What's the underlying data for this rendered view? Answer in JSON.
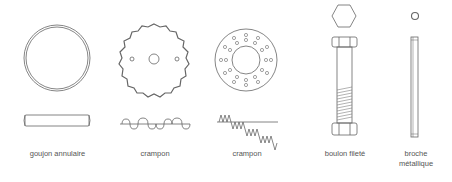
{
  "items": [
    {
      "label": "goujon annulaire"
    },
    {
      "label": "crampon"
    },
    {
      "label": "crampon"
    },
    {
      "label": "boulon fileté"
    },
    {
      "label_line1": "broche",
      "label_line2": "métallique"
    }
  ],
  "colors": {
    "stroke": "#555555",
    "text": "#555555",
    "background": "#ffffff"
  }
}
